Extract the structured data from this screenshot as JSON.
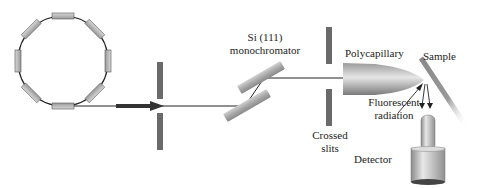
{
  "diagram": {
    "type": "x-ray fluorescence beamline schematic",
    "labels": {
      "monochromator_line1": "Si (111)",
      "monochromator_line2": "monochromator",
      "polycapillary": "Polycapillary",
      "sample": "Sample",
      "fluorescent_line1": "Fluorescent",
      "fluorescent_line2": "radiation",
      "slits_line1": "Crossed",
      "slits_line2": "slits",
      "detector": "Detector"
    },
    "components": [
      {
        "name": "storage-ring",
        "magnets": 8
      },
      {
        "name": "entrance-slit"
      },
      {
        "name": "si-111-monochromator",
        "crystals": 2
      },
      {
        "name": "crossed-slits"
      },
      {
        "name": "polycapillary-optic"
      },
      {
        "name": "sample"
      },
      {
        "name": "detector"
      }
    ],
    "colors": {
      "component_gray": "#a8a8a8",
      "slit_gray": "#666666",
      "line": "#222222",
      "background": "#ffffff"
    }
  }
}
